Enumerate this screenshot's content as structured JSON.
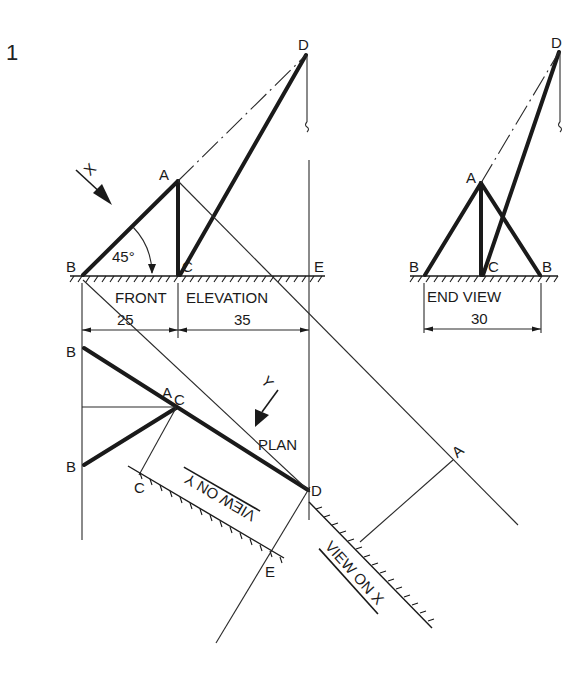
{
  "figure": {
    "number": "1",
    "views": {
      "front_elevation": {
        "title_left": "FRONT",
        "title_right": "ELEVATION",
        "points": {
          "A": "A",
          "B": "B",
          "C": "C",
          "D": "D",
          "E": "E"
        },
        "angle_label": "45°",
        "dim_left": "25",
        "dim_right": "35",
        "view_arrow_label": "X"
      },
      "end_view": {
        "title": "END VIEW",
        "points": {
          "A": "A",
          "B_left": "B",
          "B_right": "B",
          "C": "C",
          "D": "D"
        },
        "dim": "30"
      },
      "plan": {
        "title": "PLAN",
        "points": {
          "B_top": "B",
          "B_bottom": "B",
          "A": "A",
          "C": "C",
          "D": "D"
        },
        "view_arrow_label": "Y"
      },
      "view_on_y": {
        "title": "VIEW ON Y",
        "points": {
          "C": "C",
          "E": "E"
        }
      },
      "view_on_x": {
        "title": "VIEW ON X",
        "points": {
          "A": "A"
        }
      }
    },
    "colors": {
      "ink": "#1a1a1a",
      "paper": "#ffffff"
    }
  }
}
